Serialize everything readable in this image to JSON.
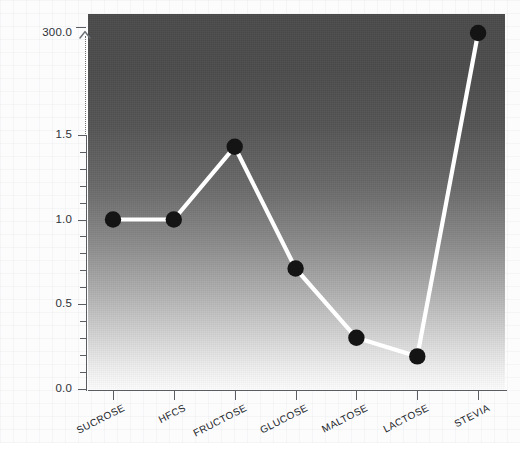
{
  "chart_data": {
    "type": "line",
    "title": "",
    "xlabel": "",
    "ylabel": "",
    "categories": [
      "SUCROSE",
      "HFCS",
      "FRUCTOSE",
      "GLUCOSE",
      "MALTOSE",
      "LACTOSE",
      "STEVIA"
    ],
    "values": [
      1.0,
      1.0,
      1.43,
      0.71,
      0.3,
      0.19,
      300.0
    ],
    "ytick_labels": [
      "0.0",
      "0.5",
      "1.0",
      "1.5",
      "300.0"
    ],
    "ytick_values": [
      0.0,
      0.5,
      1.0,
      1.5,
      300.0
    ],
    "ylim": [
      0.0,
      300.0
    ],
    "axis_break": true,
    "axis_break_note": "y-axis is broken between 1.5 and 300.0; dotted line with upward arrow marks the break",
    "minor_ticks_per_interval": 4,
    "grid": false,
    "legend": "none",
    "marker": "filled-circle",
    "marker_color": "#141414",
    "line_color": "#ffffff",
    "panel_gradient_top": "#4b4b4b",
    "panel_gradient_bottom": "#fdfdfd",
    "axis_color": "#5a5e63"
  },
  "axis": {
    "break_indicator_name": "axis-break-indicator"
  }
}
